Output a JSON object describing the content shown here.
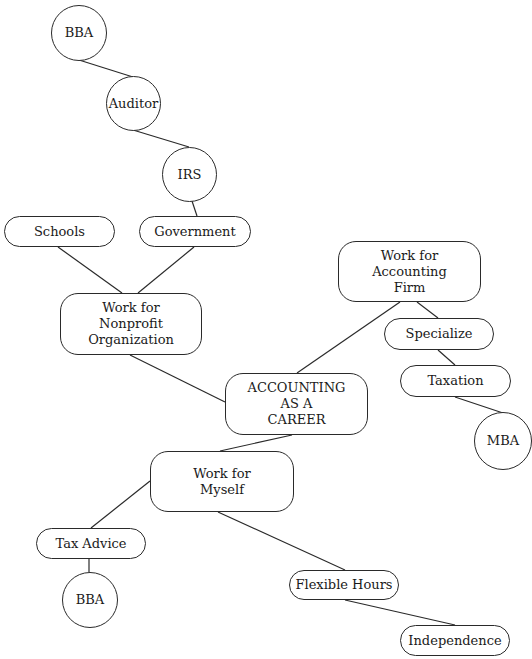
{
  "diagram": {
    "type": "concept-map",
    "title": "ACCOUNTING\nAS A\nCAREER",
    "nodes": {
      "center": "ACCOUNTING\nAS A\nCAREER",
      "nonprofit": "Work for\nNonprofit\nOrganization",
      "schools": "Schools",
      "government": "Government",
      "irs": "IRS",
      "auditor": "Auditor",
      "bba_top": "BBA",
      "firm": "Work for\nAccounting\nFirm",
      "specialize": "Specialize",
      "taxation": "Taxation",
      "mba": "MBA",
      "myself": "Work for\nMyself",
      "tax_advice": "Tax Advice",
      "bba_bottom": "BBA",
      "flexible_hours": "Flexible Hours",
      "independence": "Independence"
    },
    "edges": [
      [
        "center",
        "nonprofit"
      ],
      [
        "center",
        "firm"
      ],
      [
        "center",
        "myself"
      ],
      [
        "nonprofit",
        "schools"
      ],
      [
        "nonprofit",
        "government"
      ],
      [
        "government",
        "irs"
      ],
      [
        "irs",
        "auditor"
      ],
      [
        "auditor",
        "bba_top"
      ],
      [
        "firm",
        "specialize"
      ],
      [
        "specialize",
        "taxation"
      ],
      [
        "taxation",
        "mba"
      ],
      [
        "myself",
        "tax_advice"
      ],
      [
        "tax_advice",
        "bba_bottom"
      ],
      [
        "myself",
        "flexible_hours"
      ],
      [
        "flexible_hours",
        "independence"
      ]
    ]
  }
}
